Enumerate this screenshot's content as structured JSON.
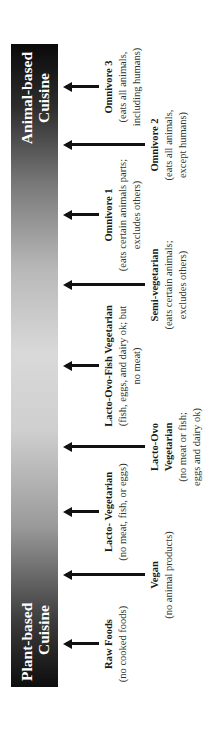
{
  "bar": {
    "left_label_line1": "Plant-based",
    "left_label_line2": "Cuisine",
    "right_label_line1": "Animal-based",
    "right_label_line2": "Cuisine",
    "gradient_end_color": "#0d0d0d",
    "gradient_mid_color": "#d9d9d9"
  },
  "diets": [
    {
      "name": "Raw Foods",
      "desc_line1": "(no cooked foods)",
      "desc_line2": "",
      "desc_line3": "",
      "arrow": "short"
    },
    {
      "name": "Vegan",
      "desc_line1": "(no animal products)",
      "desc_line2": "",
      "desc_line3": "",
      "arrow": "long"
    },
    {
      "name": "Lacto- Vegetarian",
      "desc_line1": "(no meat, fish, or eggs)",
      "desc_line2": "",
      "desc_line3": "",
      "arrow": "short"
    },
    {
      "name": "Lacto-Ovo",
      "name_line2": "Vegetarian",
      "desc_line1": "(no meat or fish;",
      "desc_line2": "eggs and dairy ok)",
      "desc_line3": "",
      "arrow": "long"
    },
    {
      "name": "Lacto-Ovo-Fish Vegetarian",
      "desc_line1": "(fish, eggs, and dairy ok; but",
      "desc_line2": "no meat)",
      "desc_line3": "",
      "arrow": "short"
    },
    {
      "name": "Semi-vegetarian",
      "desc_line1": "(eats certain animals;",
      "desc_line2": "excludes others)",
      "desc_line3": "",
      "arrow": "long"
    },
    {
      "name": "Omnivore 1",
      "desc_line1": "(eats certain animals parts;",
      "desc_line2": "excludes others)",
      "desc_line3": "",
      "arrow": "short"
    },
    {
      "name": "Omnivore 2",
      "desc_line1": "(eats all animals,",
      "desc_line2": "except humans)",
      "desc_line3": "",
      "arrow": "long"
    },
    {
      "name": "Omnivore 3",
      "desc_line1": "(eats all animals,",
      "desc_line2": "including humans)",
      "desc_line3": "",
      "arrow": "short"
    }
  ]
}
